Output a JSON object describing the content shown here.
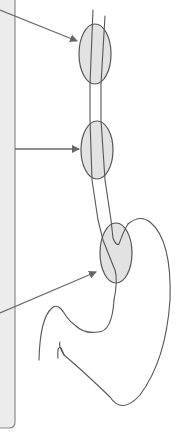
{
  "diagram": {
    "colors": {
      "panel": "#ececec",
      "panel_border": "#8a8a8a",
      "outline": "#555555",
      "zone_fill": "#e2e2e2",
      "arrow": "#666666"
    },
    "zones": [
      {
        "id": "upper-esophagus-zone",
        "label": ""
      },
      {
        "id": "middle-esophagus-zone",
        "label": ""
      },
      {
        "id": "gastroesophageal-junction-zone",
        "label": ""
      }
    ],
    "arrows": [
      {
        "id": "arrow-to-upper-zone",
        "target": "upper-esophagus-zone"
      },
      {
        "id": "arrow-to-middle-zone",
        "target": "middle-esophagus-zone"
      },
      {
        "id": "arrow-to-junction-zone",
        "target": "gastroesophageal-junction-zone"
      }
    ]
  }
}
